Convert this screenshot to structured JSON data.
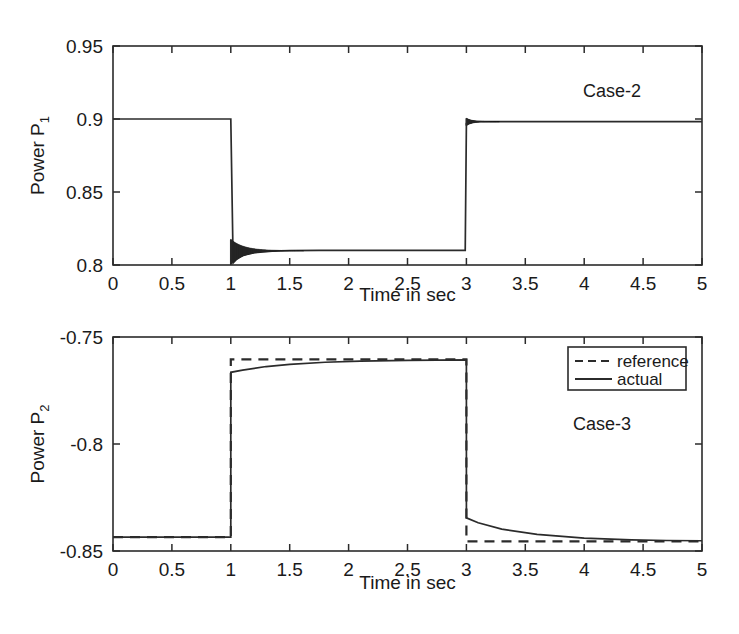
{
  "figure": {
    "background": "#ffffff",
    "ink_color": "#2b2b2b"
  },
  "chart_data": [
    {
      "type": "line",
      "title": "",
      "annotation": "Case-2",
      "xlabel": "Time in sec",
      "ylabel": "Power P",
      "ylabel_sub": "1",
      "xlim": [
        0,
        5
      ],
      "ylim": [
        0.8,
        0.95
      ],
      "xticks": [
        0,
        0.5,
        1,
        1.5,
        2,
        2.5,
        3,
        3.5,
        4,
        4.5,
        5
      ],
      "xticklabels": [
        "0",
        "0.5",
        "1",
        "1.5",
        "2",
        "2.5",
        "3",
        "3.5",
        "4",
        "4.5",
        "5"
      ],
      "yticks": [
        0.8,
        0.85,
        0.9,
        0.95
      ],
      "yticklabels": [
        "0.8",
        "0.85",
        "0.9",
        "0.95"
      ],
      "grid": false,
      "legend": "none",
      "series": [
        {
          "name": "actual",
          "style": "solid",
          "description": "Step from 0.9 to 0.81 at t=1 with fast decaying oscillation, step back to 0.898 at t=3 with damped overshoot ringing",
          "x": [
            0,
            0.25,
            0.5,
            0.75,
            1.0,
            1.02,
            1.05,
            1.1,
            1.2,
            1.35,
            1.5,
            1.75,
            2.0,
            2.25,
            2.5,
            2.75,
            2.99,
            3.0,
            3.03,
            3.07,
            3.15,
            3.3,
            3.5,
            3.75,
            4.0,
            4.25,
            4.5,
            4.75,
            5.0
          ],
          "y": [
            0.9,
            0.9,
            0.9,
            0.9,
            0.9,
            0.8015,
            0.804,
            0.8065,
            0.8085,
            0.8095,
            0.8098,
            0.81,
            0.81,
            0.81,
            0.81,
            0.81,
            0.81,
            0.897,
            0.8985,
            0.8983,
            0.8982,
            0.8982,
            0.8982,
            0.8982,
            0.8982,
            0.8982,
            0.8982,
            0.8982,
            0.8982
          ]
        }
      ],
      "transients": [
        {
          "t_start": 1.0,
          "t_end": 1.62,
          "envelope_top": 0.8175,
          "envelope_bottom": 0.8005,
          "settle": 0.8098,
          "kind": "damped-oscillation-down"
        },
        {
          "t_start": 3.0,
          "t_end": 3.28,
          "envelope_top": 0.9005,
          "envelope_bottom": 0.8955,
          "settle": 0.8982,
          "kind": "damped-oscillation-up"
        }
      ]
    },
    {
      "type": "line",
      "title": "",
      "annotation": "Case-3",
      "xlabel": "Time in sec",
      "ylabel": "Power P",
      "ylabel_sub": "2",
      "xlim": [
        0,
        5
      ],
      "ylim": [
        -0.85,
        -0.75
      ],
      "xticks": [
        0,
        0.5,
        1,
        1.5,
        2,
        2.5,
        3,
        3.5,
        4,
        4.5,
        5
      ],
      "xticklabels": [
        "0",
        "0.5",
        "1",
        "1.5",
        "2",
        "2.5",
        "3",
        "3.5",
        "4",
        "4.5",
        "5"
      ],
      "yticks": [
        -0.85,
        -0.8,
        -0.75
      ],
      "yticklabels": [
        "-0.85",
        "-0.8",
        "-0.75"
      ],
      "grid": false,
      "legend": "upper right",
      "legend_entries": [
        "reference",
        "actual"
      ],
      "series": [
        {
          "name": "reference",
          "style": "dashed",
          "description": "Ideal step reference: -0.8435 until t=1, -0.7605 from t=1 to t=3, -0.8455 after t=3",
          "x": [
            0,
            0.5,
            1.0,
            1.0,
            2.0,
            3.0,
            3.0,
            4.0,
            5.0
          ],
          "y": [
            -0.8435,
            -0.8435,
            -0.8435,
            -0.7605,
            -0.7605,
            -0.7605,
            -0.8455,
            -0.8455,
            -0.8455
          ]
        },
        {
          "name": "actual",
          "style": "solid",
          "description": "Tracks reference with first-order lag: after t=1 rises from -0.7665 asymptotically to -0.7608; after t=3 falls from -0.8345 asymptotically to -0.8452",
          "x": [
            0,
            0.5,
            1.0,
            1.0,
            1.1,
            1.3,
            1.5,
            1.8,
            2.1,
            2.5,
            3.0,
            3.0,
            3.1,
            3.3,
            3.6,
            4.0,
            4.4,
            4.7,
            5.0
          ],
          "y": [
            -0.8435,
            -0.8435,
            -0.8435,
            -0.7665,
            -0.7655,
            -0.7638,
            -0.7628,
            -0.7618,
            -0.7613,
            -0.7609,
            -0.7607,
            -0.8345,
            -0.8368,
            -0.8398,
            -0.8422,
            -0.844,
            -0.8448,
            -0.8451,
            -0.8452
          ]
        }
      ]
    }
  ]
}
